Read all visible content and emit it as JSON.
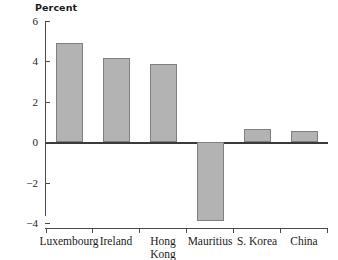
{
  "chart_data": {
    "type": "bar",
    "title": "",
    "ylabel": "Percent",
    "xlabel": "",
    "categories": [
      "Luxembourg",
      "Ireland",
      "Hong Kong",
      "Mauritius",
      "S. Korea",
      "China"
    ],
    "category_lines": [
      [
        "Luxembourg"
      ],
      [
        "Ireland"
      ],
      [
        "Hong",
        "Kong"
      ],
      [
        "Mauritius"
      ],
      [
        "S. Korea"
      ],
      [
        "China"
      ]
    ],
    "values": [
      4.9,
      4.15,
      3.85,
      -3.9,
      0.65,
      0.55
    ],
    "ylim": [
      -4,
      6
    ],
    "yticks": [
      6,
      4,
      2,
      0,
      -2,
      -4
    ],
    "ytick_labels": [
      "6",
      "4",
      "2",
      "0",
      "−2",
      "−4"
    ],
    "grid": false,
    "legend": null,
    "bar_color": "#b3b3b3",
    "bar_edge_color": "#808080",
    "axis_color": "#4a4a4a",
    "zero_line": 0
  }
}
